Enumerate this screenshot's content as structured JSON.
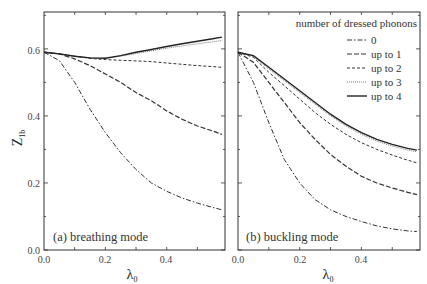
{
  "chart_data": [
    {
      "type": "line",
      "title": "(a) breathing mode",
      "xlabel": "λ0",
      "ylabel": "Z1b",
      "xlim": [
        0.0,
        0.59
      ],
      "ylim": [
        0.0,
        0.71
      ],
      "xticks": [
        "0.0",
        "0.2",
        "0.4"
      ],
      "yticks": [
        "0.0",
        "0.2",
        "0.4",
        "0.6"
      ],
      "grid": false,
      "x": [
        0.0,
        0.05,
        0.1,
        0.15,
        0.2,
        0.25,
        0.3,
        0.35,
        0.4,
        0.45,
        0.5,
        0.55,
        0.58
      ],
      "series": [
        {
          "name": "0",
          "style": "dash-dot",
          "values": [
            0.59,
            0.565,
            0.5,
            0.42,
            0.35,
            0.29,
            0.24,
            0.2,
            0.175,
            0.155,
            0.14,
            0.127,
            0.12
          ]
        },
        {
          "name": "up to 1",
          "style": "long-dash",
          "values": [
            0.59,
            0.585,
            0.57,
            0.55,
            0.525,
            0.5,
            0.47,
            0.445,
            0.415,
            0.39,
            0.37,
            0.355,
            0.345
          ]
        },
        {
          "name": "up to 2",
          "style": "short-dash",
          "values": [
            0.59,
            0.585,
            0.578,
            0.572,
            0.568,
            0.566,
            0.564,
            0.562,
            0.558,
            0.554,
            0.55,
            0.547,
            0.545
          ]
        },
        {
          "name": "up to 3",
          "style": "dotted",
          "values": [
            0.59,
            0.585,
            0.578,
            0.573,
            0.572,
            0.578,
            0.586,
            0.594,
            0.602,
            0.609,
            0.615,
            0.621,
            0.625
          ]
        },
        {
          "name": "up to 4",
          "style": "solid",
          "values": [
            0.59,
            0.585,
            0.578,
            0.573,
            0.572,
            0.58,
            0.59,
            0.598,
            0.607,
            0.615,
            0.623,
            0.63,
            0.635
          ]
        }
      ]
    },
    {
      "type": "line",
      "title": "(b) buckling mode",
      "xlabel": "λ0",
      "ylabel": "Z1b",
      "xlim": [
        0.0,
        0.59
      ],
      "ylim": [
        0.0,
        0.71
      ],
      "xticks": [
        "0.0",
        "0.2",
        "0.4"
      ],
      "yticks": [
        "0.0",
        "0.2",
        "0.4",
        "0.6"
      ],
      "grid": false,
      "legend": {
        "title": "number of dressed phonons",
        "position": "upper right",
        "entries": [
          "0",
          "up to 1",
          "up to 2",
          "up to 3",
          "up to 4"
        ]
      },
      "x": [
        0.0,
        0.05,
        0.1,
        0.15,
        0.2,
        0.25,
        0.3,
        0.35,
        0.4,
        0.45,
        0.5,
        0.55,
        0.58
      ],
      "series": [
        {
          "name": "0",
          "style": "dash-dot",
          "values": [
            0.59,
            0.5,
            0.38,
            0.27,
            0.2,
            0.15,
            0.12,
            0.1,
            0.085,
            0.072,
            0.063,
            0.057,
            0.055
          ]
        },
        {
          "name": "up to 1",
          "style": "long-dash",
          "values": [
            0.59,
            0.56,
            0.5,
            0.44,
            0.38,
            0.33,
            0.285,
            0.25,
            0.22,
            0.2,
            0.185,
            0.172,
            0.165
          ]
        },
        {
          "name": "up to 2",
          "style": "short-dash",
          "values": [
            0.59,
            0.575,
            0.53,
            0.49,
            0.45,
            0.41,
            0.375,
            0.345,
            0.32,
            0.3,
            0.283,
            0.268,
            0.26
          ]
        },
        {
          "name": "up to 3",
          "style": "dotted",
          "values": [
            0.59,
            0.578,
            0.54,
            0.505,
            0.47,
            0.435,
            0.4,
            0.37,
            0.345,
            0.325,
            0.31,
            0.298,
            0.293
          ]
        },
        {
          "name": "up to 4",
          "style": "solid",
          "values": [
            0.59,
            0.58,
            0.545,
            0.51,
            0.475,
            0.44,
            0.405,
            0.375,
            0.35,
            0.33,
            0.315,
            0.303,
            0.298
          ]
        }
      ]
    }
  ],
  "labels": {
    "ylabel": "Z",
    "ylabel_sub": "1b",
    "xlabel": "λ",
    "xlabel_sub": "0",
    "panel_a": "(a) breathing mode",
    "panel_b": "(b) buckling mode",
    "legend_title": "number of dressed phonons",
    "legend_entries": [
      "0",
      "up to 1",
      "up to 2",
      "up to 3",
      "up to 4"
    ],
    "yticks": [
      "0.0",
      "0.2",
      "0.4",
      "0.6"
    ],
    "xticks": [
      "0.0",
      "0.2",
      "0.4"
    ]
  }
}
